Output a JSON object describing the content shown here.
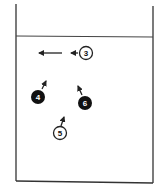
{
  "diagram": {
    "type": "container-with-water-and-particles",
    "colors": {
      "line": "#222222",
      "background": "#ffffff",
      "filled_marker": "#111111",
      "filled_text": "#ffffff"
    },
    "markers": [
      {
        "id": "3",
        "label": "3",
        "style": "open",
        "cx": 86,
        "cy": 53,
        "arrow": {
          "from": [
            78,
            53
          ],
          "to": [
            70,
            53
          ]
        }
      },
      {
        "id": "4",
        "label": "4",
        "style": "filled",
        "cx": 38,
        "cy": 97,
        "arrow": {
          "from": [
            42,
            89
          ],
          "to": [
            46,
            80
          ]
        }
      },
      {
        "id": "6",
        "label": "6",
        "style": "filled",
        "cx": 85,
        "cy": 103,
        "arrow": {
          "from": [
            82,
            94
          ],
          "to": [
            78,
            85
          ]
        }
      },
      {
        "id": "5",
        "label": "5",
        "style": "open",
        "cx": 60,
        "cy": 133,
        "arrow": {
          "from": [
            61,
            125
          ],
          "to": [
            64,
            116
          ]
        }
      }
    ],
    "free_arrows": [
      {
        "from": [
          62,
          53
        ],
        "to": [
          39,
          53
        ]
      }
    ]
  }
}
